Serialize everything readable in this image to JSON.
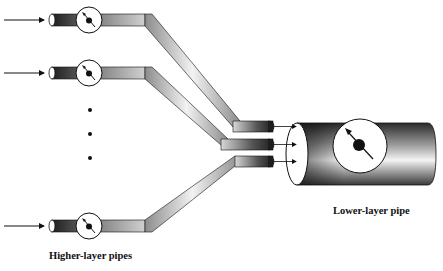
{
  "diagram": {
    "labels": {
      "higher_layer": "Higher-layer pipes",
      "lower_layer": "Lower-layer pipe"
    },
    "higher_layer_pipes": [
      {
        "id": "pipe-1",
        "y": 20,
        "has_input_arrow": true,
        "has_gauge": true
      },
      {
        "id": "pipe-2",
        "y": 73,
        "has_input_arrow": true,
        "has_gauge": true
      },
      {
        "id": "pipe-n",
        "y": 226,
        "has_input_arrow": true,
        "has_gauge": true
      }
    ],
    "ellipsis_dots": 3,
    "lower_layer_pipe": {
      "inputs": 3,
      "has_gauge": true
    },
    "colors": {
      "pipe_dark": "#222222",
      "pipe_light": "#e8e8e8",
      "outline": "#111111",
      "background": "#ffffff"
    }
  }
}
